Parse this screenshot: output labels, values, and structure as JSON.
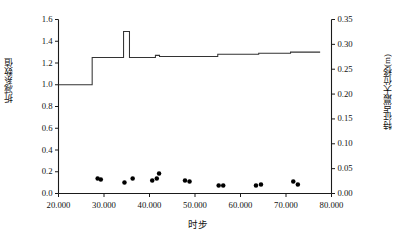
{
  "chart_data": {
    "type": "scatter",
    "title": "",
    "xlabel": "时步",
    "ylabel": "折减系数值",
    "y2label": "特征点最大位移(m)",
    "xlim": [
      20.0,
      80.0
    ],
    "ylim": [
      0.0,
      1.6
    ],
    "y2lim": [
      0.0,
      0.35
    ],
    "grid": false,
    "legend": null,
    "x_ticks": [
      "20.000",
      "30.000",
      "40.000",
      "50.000",
      "60.000",
      "70.000",
      "80.000"
    ],
    "x_tick_values": [
      20,
      30,
      40,
      50,
      60,
      70,
      80
    ],
    "y_ticks": [
      "0.0",
      "0.2",
      "0.4",
      "0.6",
      "0.8",
      "1.0",
      "1.2",
      "1.4",
      "1.6"
    ],
    "y_tick_values": [
      0.0,
      0.2,
      0.4,
      0.6,
      0.8,
      1.0,
      1.2,
      1.4,
      1.6
    ],
    "y2_ticks": [
      "0.00",
      "0.05",
      "0.10",
      "0.15",
      "0.20",
      "0.25",
      "0.30",
      "0.35"
    ],
    "y2_tick_values": [
      0.0,
      0.05,
      0.1,
      0.15,
      0.2,
      0.25,
      0.3,
      0.35
    ],
    "series": [
      {
        "name": "折减系数值",
        "type": "step",
        "axis": "left",
        "color": "#333333",
        "points": [
          [
            20.0,
            1.0
          ],
          [
            27.4,
            1.0
          ],
          [
            27.4,
            1.25
          ],
          [
            34.3,
            1.25
          ],
          [
            34.3,
            1.49
          ],
          [
            35.6,
            1.49
          ],
          [
            35.6,
            1.25
          ],
          [
            41.3,
            1.25
          ],
          [
            41.3,
            1.27
          ],
          [
            42.2,
            1.27
          ],
          [
            42.2,
            1.26
          ],
          [
            55.0,
            1.26
          ],
          [
            55.0,
            1.28
          ],
          [
            64.0,
            1.28
          ],
          [
            64.0,
            1.29
          ],
          [
            71.0,
            1.29
          ],
          [
            71.0,
            1.3
          ],
          [
            77.5,
            1.3
          ]
        ]
      },
      {
        "name": "特征点最大位移(m)",
        "type": "scatter",
        "axis": "right",
        "color": "#000000",
        "points": [
          [
            20.5,
            0.4
          ],
          [
            22.0,
            0.515
          ],
          [
            22.6,
            0.522
          ],
          [
            23.2,
            0.533
          ],
          [
            23.8,
            0.541
          ],
          [
            24.4,
            0.551
          ],
          [
            25.0,
            0.558
          ],
          [
            27.0,
            0.56
          ],
          [
            28.9,
            0.772
          ],
          [
            29.4,
            0.8
          ],
          [
            30.1,
            0.845
          ],
          [
            30.8,
            0.92
          ],
          [
            31.5,
            0.94
          ],
          [
            32.8,
            0.98
          ],
          [
            33.5,
            0.985
          ],
          [
            34.1,
            0.985
          ],
          [
            34.9,
            0.88
          ],
          [
            36.0,
            1.045
          ],
          [
            36.9,
            1.148
          ],
          [
            38.0,
            1.23
          ],
          [
            38.7,
            1.255
          ],
          [
            39.3,
            1.268
          ],
          [
            40.9,
            1.33
          ],
          [
            41.5,
            1.34
          ],
          [
            41.9,
            1.342
          ],
          [
            43.0,
            0.783
          ],
          [
            43.6,
            0.845
          ],
          [
            44.6,
            0.92
          ],
          [
            45.4,
            0.99
          ],
          [
            46.3,
            1.03
          ],
          [
            47.1,
            1.05
          ],
          [
            47.9,
            1.055
          ],
          [
            48.6,
            1.06
          ],
          [
            50.3,
            0.785
          ],
          [
            51.0,
            0.875
          ],
          [
            51.9,
            0.96
          ],
          [
            52.6,
            1.01
          ],
          [
            53.3,
            1.04
          ],
          [
            54.1,
            1.065
          ],
          [
            54.8,
            1.085
          ],
          [
            55.4,
            1.098
          ],
          [
            56.1,
            1.118
          ],
          [
            56.8,
            1.128
          ],
          [
            58.4,
            0.82
          ],
          [
            59.2,
            0.93
          ],
          [
            60.1,
            1.03
          ],
          [
            60.8,
            1.075
          ],
          [
            61.5,
            1.105
          ],
          [
            62.1,
            1.122
          ],
          [
            62.8,
            1.14
          ],
          [
            63.4,
            1.155
          ],
          [
            64.1,
            1.168
          ],
          [
            64.8,
            1.178
          ],
          [
            65.8,
            0.862
          ],
          [
            66.6,
            0.985
          ],
          [
            67.5,
            1.095
          ],
          [
            68.3,
            1.15
          ],
          [
            69.0,
            1.19
          ],
          [
            69.6,
            1.222
          ],
          [
            70.3,
            1.248
          ],
          [
            71.0,
            1.27
          ],
          [
            71.7,
            1.288
          ],
          [
            72.6,
            0.9
          ],
          [
            73.4,
            1.04
          ],
          [
            74.3,
            1.165
          ],
          [
            74.9,
            1.23
          ],
          [
            75.5,
            1.272
          ],
          [
            76.0,
            1.3
          ],
          [
            76.4,
            1.322
          ],
          [
            76.8,
            1.338
          ],
          [
            28.6,
            0.03
          ],
          [
            29.3,
            0.028
          ],
          [
            34.5,
            0.022
          ],
          [
            36.3,
            0.03
          ],
          [
            40.6,
            0.026
          ],
          [
            41.6,
            0.03
          ],
          [
            42.1,
            0.04
          ],
          [
            47.8,
            0.026
          ],
          [
            48.8,
            0.024
          ],
          [
            55.2,
            0.016
          ],
          [
            56.2,
            0.016
          ],
          [
            63.4,
            0.016
          ],
          [
            64.5,
            0.018
          ],
          [
            71.6,
            0.024
          ],
          [
            72.6,
            0.018
          ]
        ]
      }
    ]
  }
}
